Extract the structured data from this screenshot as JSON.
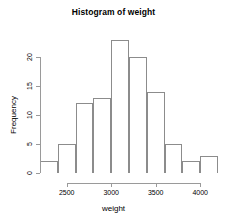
{
  "chart_data": {
    "type": "bar",
    "title": "Histogram of weight",
    "xlabel": "weight",
    "ylabel": "Frequency",
    "grid": false,
    "legend": null,
    "bin_width": 200,
    "bin_edges": [
      2200,
      2400,
      2600,
      2800,
      3000,
      3200,
      3400,
      3600,
      3800,
      4000,
      4200
    ],
    "categories": [
      "2200-2400",
      "2400-2600",
      "2600-2800",
      "2800-3000",
      "3000-3200",
      "3200-3400",
      "3400-3600",
      "3600-3800",
      "3800-4000",
      "4000-4200"
    ],
    "values": [
      2,
      5,
      12,
      13,
      23,
      20,
      14,
      5,
      2,
      3
    ],
    "bin_centers": [
      2300,
      2500,
      2700,
      2900,
      3100,
      3300,
      3500,
      3700,
      3900,
      4100
    ],
    "xlim": [
      2200,
      4200
    ],
    "ylim": [
      0,
      23
    ],
    "x_ticks": [
      2500,
      3000,
      3500,
      4000
    ],
    "x_tick_labels": [
      "2500",
      "3000",
      "3500",
      "4000"
    ],
    "y_ticks": [
      0,
      5,
      10,
      15,
      20
    ],
    "y_tick_labels": [
      "0",
      "5",
      "10",
      "15",
      "20"
    ],
    "bar_color": "#ffffff",
    "bar_border_color": "#8c8c8c",
    "axis_color": "#9a9a9a",
    "background": "#ffffff"
  }
}
